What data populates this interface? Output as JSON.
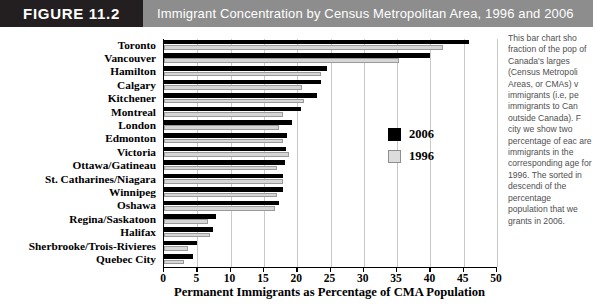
{
  "header": {
    "figure_tag": "FIGURE 11.2",
    "title": "Immigrant Concentration by Census Metropolitan Area, 1996 and 2006"
  },
  "legend": {
    "items": [
      {
        "label": "2006",
        "color": "#000000",
        "swatch": "black-square-icon"
      },
      {
        "label": "1996",
        "color": "#dcdcdc",
        "swatch": "gray-square-icon"
      }
    ]
  },
  "sidenote": {
    "text": "This bar chart sho fraction of the pop of Canada's larges (Census Metropoli Areas, or CMAs) v immigrants (i.e, pe immigrants to Can outside Canada). F city we show two percentage of eac are immigrants in the corresponding age for 1996. The sorted in descendi of the percentage population that we grants in 2006."
  },
  "chart_data": {
    "type": "bar",
    "orientation": "horizontal",
    "title": "Immigrant Concentration by Census Metropolitan Area, 1996 and 2006",
    "xlabel": "Permanent Immigrants as Percentage of CMA Population",
    "ylabel": "",
    "xlim": [
      0,
      50
    ],
    "xticks": [
      0,
      5,
      10,
      15,
      20,
      25,
      30,
      35,
      40,
      45,
      50
    ],
    "grid": true,
    "grid_axis": "x",
    "legend_position": "right-inside",
    "categories": [
      "Toronto",
      "Vancouver",
      "Hamilton",
      "Calgary",
      "Kitchener",
      "Montreal",
      "London",
      "Edmonton",
      "Victoria",
      "Ottawa/Gatineau",
      "St. Catharines/Niagara",
      "Winnipeg",
      "Oshawa",
      "Regina/Saskatoon",
      "Halifax",
      "Sherbrooke/Trois-Rivieres",
      "Quebec City"
    ],
    "series": [
      {
        "name": "2006",
        "color": "#000000",
        "values": [
          45.8,
          40.0,
          24.5,
          23.5,
          23.0,
          20.6,
          19.2,
          18.5,
          18.3,
          18.1,
          17.9,
          17.8,
          17.3,
          7.8,
          7.4,
          5.0,
          4.4
        ]
      },
      {
        "name": "1996",
        "color": "#dcdcdc",
        "values": [
          41.9,
          35.3,
          23.6,
          20.7,
          21.0,
          17.8,
          17.2,
          17.8,
          18.8,
          17.0,
          17.9,
          16.9,
          16.6,
          6.6,
          6.9,
          3.6,
          3.0
        ]
      }
    ]
  }
}
